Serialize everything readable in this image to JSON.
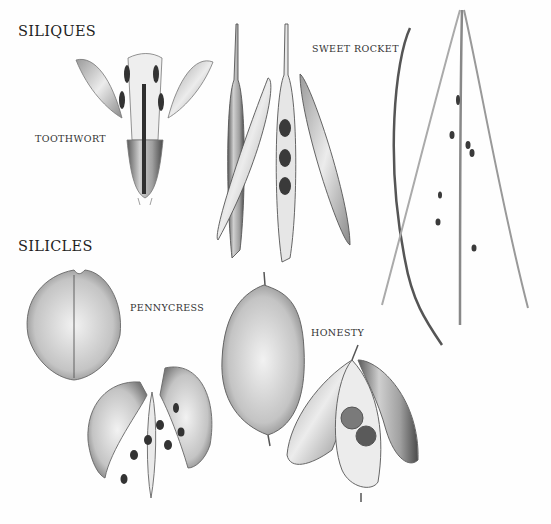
{
  "headings": {
    "siliques": "SILIQUES",
    "silicles": "SILICLES"
  },
  "labels": {
    "toothwort": "TOOTHWORT",
    "sweet_rocket": "SWEET ROCKET",
    "pennycress": "PENNYCRESS",
    "honesty": "HONESTY"
  },
  "colors": {
    "background": "#fefefe",
    "ink": "#2a2a2a",
    "shade_light": "#d8d8d8",
    "shade_mid": "#9a9a9a",
    "shade_dark": "#3c3c3c"
  }
}
